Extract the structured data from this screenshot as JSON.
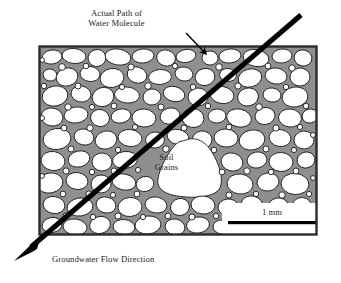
{
  "figure": {
    "type": "soil-grain-groundwater-diagram",
    "background_color": "#ffffff"
  },
  "labels": {
    "actual_path": "Actual Path of\nWater Molecule",
    "soil_grains": "Soil\nGrains",
    "flow_direction": "Groundwater Flow Direction"
  },
  "scale_bar": {
    "label": "1 mm",
    "length_px": 88
  },
  "colors": {
    "grain_fill": "#ffffff",
    "grain_outline": "#1a1a1a",
    "pore_space": "#8f8f8f",
    "frame_border": "#2b2b2b",
    "arrow": "#000000",
    "text": "#1d1d1d"
  },
  "frame": {
    "x": 38,
    "y": 45,
    "width": 280,
    "height": 191
  },
  "flow_arrow": {
    "start_x": 301,
    "start_y": 15,
    "end_x": 17,
    "end_y": 259,
    "width_px": 5
  },
  "leader_arrow": {
    "start_x": 186,
    "start_y": 33,
    "end_x": 207,
    "end_y": 55
  }
}
